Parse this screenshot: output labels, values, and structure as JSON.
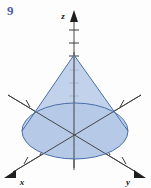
{
  "figure": {
    "exercise_number": "9",
    "caption": "",
    "background_color": "#fdfdfd",
    "axes": {
      "z_label": "z",
      "x_label": "x",
      "y_label": "y",
      "axis_color": "#4a4a4a",
      "tick_color": "#3a3a3a",
      "origin": {
        "x": 74,
        "y": 131
      },
      "z_axis": {
        "x1": 74,
        "y1": 168,
        "x2": 74,
        "y2": 14,
        "ticks": 9
      },
      "x_axis": {
        "x1": 139,
        "y1": 96,
        "x2": 12,
        "y2": 172,
        "ticks": 8
      },
      "y_axis": {
        "x1": 9,
        "y1": 96,
        "x2": 136,
        "y2": 172,
        "ticks": 8
      }
    },
    "solid": {
      "name": "cone",
      "apex": {
        "x": 74,
        "y": 55
      },
      "base_ellipse": {
        "cx": 75,
        "cy": 131,
        "rx": 53,
        "ry": 28
      },
      "fill_color": "#b9cce8",
      "fill_opacity": 0.85,
      "stroke_color": "#4a6fa8"
    },
    "label_positions": {
      "z": {
        "x": 64,
        "y": 16
      },
      "x": {
        "x": 16,
        "y": 182
      },
      "y": {
        "x": 131,
        "y": 182
      }
    }
  }
}
